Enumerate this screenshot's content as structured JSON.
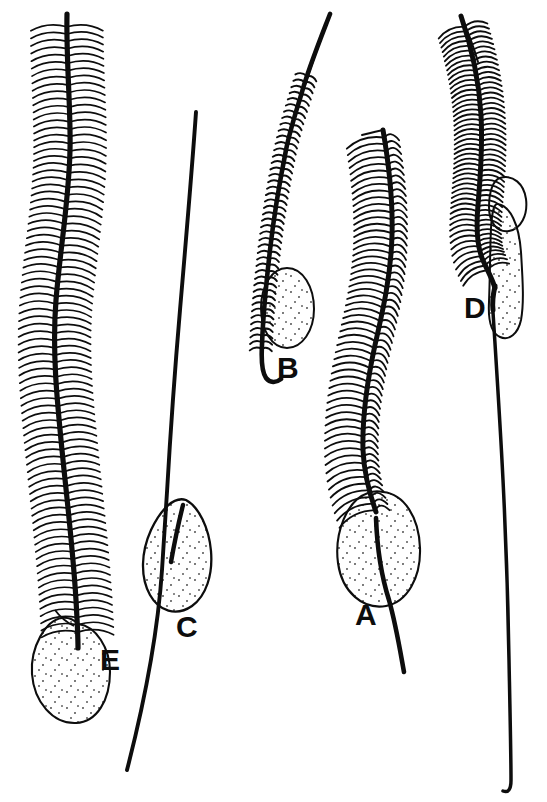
{
  "figure": {
    "background_color": "#ffffff",
    "ink_color": "#0d0d0d",
    "stipple_color": "#4a4a4a",
    "width": 547,
    "height": 802,
    "panel_count": 5,
    "label_font_size": 30
  },
  "panels": [
    {
      "id": "A",
      "label": "A",
      "label_x": 355,
      "label_y": 625,
      "type": "pinnate-seta-with-ovoid-bulb",
      "barb_style": "long-curved-barbs-both-sides",
      "bulb_shape": "broad-ovoid",
      "bulb_stippled": true,
      "shaft_top_x": 383,
      "shaft_top_y": 130,
      "shaft_bottom_x": 404,
      "shaft_bottom_y": 672
    },
    {
      "id": "B",
      "label": "B",
      "label_x": 277,
      "label_y": 378,
      "type": "plumose-seta-with-lateral-ovoid-bulb",
      "barb_style": "short-stubby-barbs-both-sides",
      "bulb_shape": "narrow-ovoid",
      "bulb_stippled": true,
      "shaft_top_x": 330,
      "shaft_top_y": 14,
      "shaft_bottom_x": 265,
      "shaft_bottom_y": 382
    },
    {
      "id": "C",
      "label": "C",
      "label_x": 176,
      "label_y": 637,
      "type": "smooth-seta-with-lanceolate-blade",
      "barb_style": "none",
      "bulb_shape": "lanceolate-blade",
      "bulb_stippled": true,
      "shaft_top_x": 196,
      "shaft_top_y": 112,
      "shaft_bottom_x": 127,
      "shaft_bottom_y": 770
    },
    {
      "id": "D",
      "label": "D",
      "label_x": 464,
      "label_y": 318,
      "type": "pinnate-seta-with-elongate-double-lobed-blade",
      "barb_style": "medium-barbs-both-sides",
      "bulb_shape": "elongate-lobe-plus-small-loop",
      "bulb_stippled": true,
      "shaft_top_x": 461,
      "shaft_top_y": 16,
      "shaft_bottom_x": 511,
      "shaft_bottom_y": 790
    },
    {
      "id": "E",
      "label": "E",
      "label_x": 100,
      "label_y": 670,
      "type": "densely-pinnate-seta-with-large-pyriform-bulb",
      "barb_style": "dense-long-wavy-barbs-both-sides",
      "bulb_shape": "large-pyriform",
      "bulb_stippled": true,
      "shaft_top_x": 67,
      "shaft_top_y": 14,
      "shaft_bottom_x": 78,
      "shaft_bottom_y": 650
    }
  ],
  "labels": {
    "a": "A",
    "b": "B",
    "c": "C",
    "d": "D",
    "e": "E"
  }
}
